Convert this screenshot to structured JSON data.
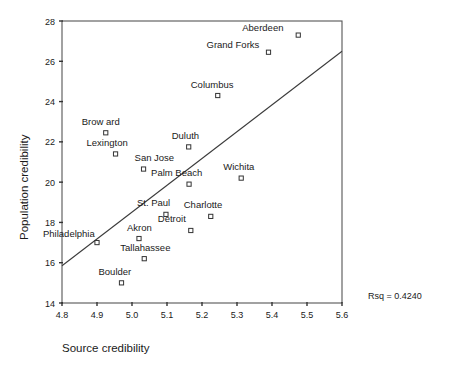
{
  "chart_data": {
    "type": "scatter",
    "title": "",
    "xlabel": "Source credibility",
    "ylabel": "Population credibility",
    "xlim": [
      4.8,
      5.6
    ],
    "ylim": [
      14,
      28
    ],
    "xticks": [
      "4.8",
      "4.9",
      "5.0",
      "5.1",
      "5.2",
      "5.3",
      "5.4",
      "5.5",
      "5.6"
    ],
    "xtick_values": [
      4.8,
      4.9,
      5.0,
      5.1,
      5.2,
      5.3,
      5.4,
      5.5,
      5.6
    ],
    "yticks": [
      "14",
      "16",
      "18",
      "20",
      "22",
      "24",
      "26",
      "28"
    ],
    "ytick_values": [
      14,
      16,
      18,
      20,
      22,
      24,
      26,
      28
    ],
    "grid": false,
    "legend": null,
    "annotation": "Rsq = 0.4240",
    "fit_line": {
      "type": "linear-regression",
      "x_start": 4.8,
      "y_start": 15.85,
      "x_end": 5.6,
      "y_end": 26.5
    },
    "points": [
      {
        "label": "Aberdeen",
        "x": 5.475,
        "y": 27.3,
        "label_dx": -56,
        "label_dy": -4
      },
      {
        "label": "Grand Forks",
        "x": 5.39,
        "y": 26.45,
        "label_dx": -62,
        "label_dy": -4
      },
      {
        "label": "Columbus",
        "x": 5.245,
        "y": 24.3,
        "label_dx": -27,
        "label_dy": -8
      },
      {
        "label": "Brow ard",
        "x": 4.925,
        "y": 22.45,
        "label_dx": -24,
        "label_dy": -8
      },
      {
        "label": "Lexington",
        "x": 4.953,
        "y": 21.4,
        "label_dx": -29,
        "label_dy": -8
      },
      {
        "label": "Duluth",
        "x": 5.162,
        "y": 21.75,
        "label_dx": -17,
        "label_dy": -8
      },
      {
        "label": "San Jose",
        "x": 5.033,
        "y": 20.65,
        "label_dx": -9,
        "label_dy": -8
      },
      {
        "label": "Palm Beach",
        "x": 5.163,
        "y": 19.9,
        "label_dx": -38,
        "label_dy": -8
      },
      {
        "label": "Wichita",
        "x": 5.312,
        "y": 20.2,
        "label_dx": -18,
        "label_dy": -8
      },
      {
        "label": "St. Paul",
        "x": 5.097,
        "y": 18.4,
        "label_dx": -29,
        "label_dy": -8
      },
      {
        "label": "Charlotte",
        "x": 5.225,
        "y": 18.3,
        "label_dx": -27,
        "label_dy": -8
      },
      {
        "label": "Detroit",
        "x": 5.168,
        "y": 17.6,
        "label_dx": -33,
        "label_dy": -8
      },
      {
        "label": "Akron",
        "x": 5.02,
        "y": 17.2,
        "label_dx": -12,
        "label_dy": -8
      },
      {
        "label": "Philadelphia",
        "x": 4.9,
        "y": 17.0,
        "label_dx": -54,
        "label_dy": -6
      },
      {
        "label": "Tallahassee",
        "x": 5.035,
        "y": 16.2,
        "label_dx": -24,
        "label_dy": -8
      },
      {
        "label": "Boulder",
        "x": 4.97,
        "y": 15.0,
        "label_dx": -23,
        "label_dy": -8
      }
    ]
  },
  "axes": {
    "x_title": "Source credibility",
    "y_title": "Population credibility"
  },
  "stats": {
    "rsq_text": "Rsq = 0.4240"
  }
}
